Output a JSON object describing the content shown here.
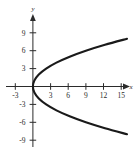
{
  "chart_data": {
    "type": "line",
    "title": "",
    "subtitle": "",
    "xlabel": "x",
    "ylabel": "y",
    "xlim": [
      -4.5,
      18.5
    ],
    "ylim": [
      -10.5,
      10.5
    ],
    "grid": false,
    "legend": null,
    "xticks": [
      -3,
      3,
      6,
      9,
      12,
      15
    ],
    "xticklabels": [
      "-3",
      "3",
      "6",
      "9",
      "12",
      "15"
    ],
    "yticks": [
      -9,
      -6,
      -3,
      3,
      6,
      9
    ],
    "yticklabels": [
      "-9",
      "-6",
      "-3",
      "3",
      "6",
      "9"
    ],
    "axis_arrows": {
      "x_positive": true,
      "y_positive": true
    },
    "curve_color": "#1a1a1a",
    "axis_color": "#2b2b2b",
    "background": "#ffffff",
    "series": [
      {
        "name": "parabola",
        "equation": "y^2 = 4x",
        "orientation": "opens-right",
        "vertex": [
          0,
          0
        ],
        "points": [
          [
            16.0,
            -8.0
          ],
          [
            12.25,
            -7.0
          ],
          [
            9.0,
            -6.0
          ],
          [
            6.25,
            -5.0
          ],
          [
            4.0,
            -4.0
          ],
          [
            2.25,
            -3.0
          ],
          [
            1.0,
            -2.0
          ],
          [
            0.25,
            -1.0
          ],
          [
            0.0,
            0.0
          ],
          [
            0.25,
            1.0
          ],
          [
            1.0,
            2.0
          ],
          [
            2.25,
            3.0
          ],
          [
            4.0,
            4.0
          ],
          [
            6.25,
            5.0
          ],
          [
            9.0,
            6.0
          ],
          [
            12.25,
            7.0
          ],
          [
            16.0,
            8.0
          ]
        ]
      }
    ]
  }
}
